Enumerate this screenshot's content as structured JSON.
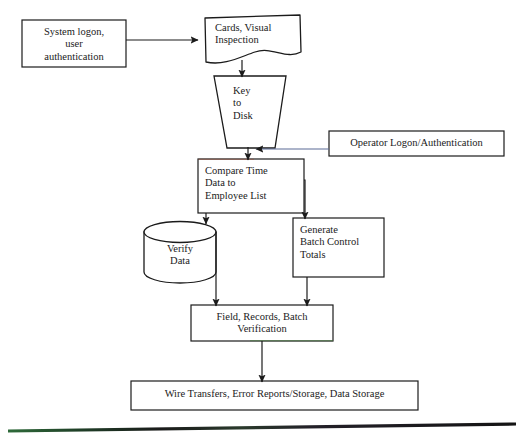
{
  "diagram": {
    "background_color": "#ffffff",
    "stroke_color": "#1b1b1b",
    "nodes": [
      {
        "id": "system-logon",
        "shape": "rectangle",
        "label": "System logon,\nuser\nauthentication",
        "align": "center",
        "x": 22,
        "y": 20,
        "w": 104,
        "h": 47,
        "font_size": 10.5
      },
      {
        "id": "cards-visual-inspection",
        "shape": "document",
        "label": "Cards, Visual\nInspection",
        "align": "left",
        "x": 205,
        "y": 17,
        "w": 96,
        "h": 45,
        "font_size": 10.5
      },
      {
        "id": "key-to-disk",
        "shape": "manual-operation",
        "label": "Key\nto\nDisk",
        "align": "left",
        "x": 214,
        "y": 76,
        "w": 72,
        "h": 72,
        "font_size": 10.5
      },
      {
        "id": "operator-logon",
        "shape": "rectangle",
        "label": "Operator Logon/Authentication",
        "align": "center",
        "x": 329,
        "y": 131,
        "w": 175,
        "h": 25,
        "font_size": 10.5
      },
      {
        "id": "compare-time-data",
        "shape": "rectangle",
        "label": "Compare Time\nData to\nEmployee List",
        "align": "left",
        "x": 198,
        "y": 159,
        "w": 106,
        "h": 54,
        "font_size": 10.5
      },
      {
        "id": "verify-data",
        "shape": "cylinder",
        "label": "Verify\nData",
        "align": "center",
        "x": 144,
        "y": 222,
        "w": 72,
        "h": 60,
        "font_size": 10.5
      },
      {
        "id": "generate-batch-control-totals",
        "shape": "rectangle",
        "label": "Generate\nBatch Control\nTotals",
        "align": "left",
        "x": 293,
        "y": 218,
        "w": 91,
        "h": 59,
        "font_size": 10.5
      },
      {
        "id": "field-records-batch-verification",
        "shape": "rectangle",
        "label": "Field, Records, Batch\nVerification",
        "align": "center",
        "x": 191,
        "y": 305,
        "w": 142,
        "h": 36,
        "font_size": 10.5
      },
      {
        "id": "wire-transfers-storage",
        "shape": "rectangle",
        "label": "Wire Transfers, Error Reports/Storage, Data Storage",
        "align": "center",
        "x": 131,
        "y": 381,
        "w": 287,
        "h": 29,
        "font_size": 10.5
      }
    ],
    "connectors": [
      {
        "id": "system-logon-to-cards",
        "from": "system-logon",
        "to": "cards-visual-inspection",
        "direction": "right"
      },
      {
        "id": "cards-to-key-to-disk",
        "from": "cards-visual-inspection",
        "to": "key-to-disk",
        "direction": "down"
      },
      {
        "id": "key-to-disk-to-compare",
        "from": "key-to-disk",
        "to": "compare-time-data",
        "direction": "down"
      },
      {
        "id": "operator-logon-to-compare",
        "from": "operator-logon",
        "to": "compare-time-data",
        "direction": "left"
      },
      {
        "id": "compare-to-verify-data",
        "from": "compare-time-data",
        "to": "verify-data",
        "direction": "down-left"
      },
      {
        "id": "compare-to-generate-batch",
        "from": "compare-time-data",
        "to": "generate-batch-control-totals",
        "direction": "down-right"
      },
      {
        "id": "verify-data-to-field-records",
        "from": "verify-data",
        "to": "field-records-batch-verification",
        "direction": "down"
      },
      {
        "id": "generate-batch-to-field-records",
        "from": "generate-batch-control-totals",
        "to": "field-records-batch-verification",
        "direction": "down"
      },
      {
        "id": "field-records-to-wire-transfers",
        "from": "field-records-batch-verification",
        "to": "wire-transfers-storage",
        "direction": "down"
      }
    ],
    "scan_artifact_line": {
      "id": "bottom-scan-line",
      "color_left": "#2f6b3a",
      "color_right": "#171717"
    }
  }
}
